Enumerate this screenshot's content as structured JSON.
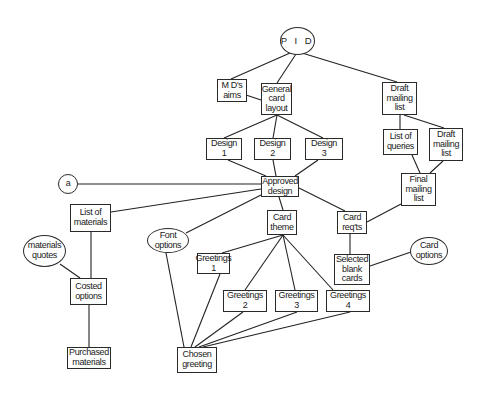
{
  "diagram": {
    "type": "product-flow-diagram",
    "nodes": {
      "pid": {
        "shape": "ellipse",
        "lines": [
          "P I D"
        ]
      },
      "md_aims": {
        "shape": "box",
        "lines": [
          "M  D's",
          "aims"
        ]
      },
      "general_card_layout": {
        "shape": "box",
        "lines": [
          "General",
          "card",
          "layout"
        ]
      },
      "draft_mailing_list": {
        "shape": "box",
        "lines": [
          "Draft",
          "mailing",
          "list"
        ]
      },
      "design_1": {
        "shape": "box",
        "lines": [
          "Design",
          "1"
        ]
      },
      "design_2": {
        "shape": "box",
        "lines": [
          "Design",
          "2"
        ]
      },
      "design_3": {
        "shape": "box",
        "lines": [
          "Design",
          "3"
        ]
      },
      "list_of_queries": {
        "shape": "box",
        "lines": [
          "List  of",
          "queries"
        ]
      },
      "draft_mailing_list_2": {
        "shape": "box",
        "lines": [
          "Draft",
          "mailing",
          "list"
        ]
      },
      "connector_a": {
        "shape": "circle",
        "lines": [
          "a"
        ]
      },
      "approved_design": {
        "shape": "box",
        "lines": [
          "Approved",
          "design"
        ]
      },
      "final_mailing_list": {
        "shape": "box",
        "lines": [
          "Final",
          "mailing",
          "list"
        ]
      },
      "list_of_materials": {
        "shape": "box",
        "lines": [
          "List  of",
          "materials"
        ]
      },
      "font_options": {
        "shape": "ellipse",
        "lines": [
          "Font",
          "options"
        ]
      },
      "card_theme": {
        "shape": "box",
        "lines": [
          "Card",
          "theme"
        ]
      },
      "card_reqts": {
        "shape": "box",
        "lines": [
          "Card",
          "req'ts"
        ]
      },
      "materials_quotes": {
        "shape": "ellipse",
        "lines": [
          "materials",
          "quotes"
        ]
      },
      "greetings_1": {
        "shape": "box",
        "lines": [
          "Greetings",
          "1"
        ]
      },
      "selected_blank_cards": {
        "shape": "box",
        "lines": [
          "Selected",
          "blank",
          "cards"
        ]
      },
      "card_options": {
        "shape": "ellipse",
        "lines": [
          "Card",
          "options"
        ]
      },
      "costed_options": {
        "shape": "box",
        "lines": [
          "Costed",
          "options"
        ]
      },
      "greetings_2": {
        "shape": "box",
        "lines": [
          "Greetings",
          "2"
        ]
      },
      "greetings_3": {
        "shape": "box",
        "lines": [
          "Greetings",
          "3"
        ]
      },
      "greetings_4": {
        "shape": "box",
        "lines": [
          "Greetings",
          "4"
        ]
      },
      "purchased_materials": {
        "shape": "box",
        "lines": [
          "Purchased",
          "materials"
        ]
      },
      "chosen_greeting": {
        "shape": "box",
        "lines": [
          "Chosen",
          "greeting"
        ]
      }
    },
    "edges": [
      [
        "pid",
        "md_aims"
      ],
      [
        "pid",
        "general_card_layout"
      ],
      [
        "pid",
        "draft_mailing_list"
      ],
      [
        "md_aims",
        "general_card_layout"
      ],
      [
        "general_card_layout",
        "design_1"
      ],
      [
        "general_card_layout",
        "design_2"
      ],
      [
        "general_card_layout",
        "design_3"
      ],
      [
        "design_1",
        "approved_design"
      ],
      [
        "design_2",
        "approved_design"
      ],
      [
        "design_3",
        "approved_design"
      ],
      [
        "connector_a",
        "approved_design"
      ],
      [
        "list_of_materials",
        "approved_design"
      ],
      [
        "font_options",
        "approved_design"
      ],
      [
        "approved_design",
        "card_theme"
      ],
      [
        "approved_design",
        "card_reqts"
      ],
      [
        "draft_mailing_list",
        "list_of_queries"
      ],
      [
        "draft_mailing_list",
        "draft_mailing_list_2"
      ],
      [
        "list_of_queries",
        "final_mailing_list"
      ],
      [
        "draft_mailing_list_2",
        "final_mailing_list"
      ],
      [
        "final_mailing_list",
        "card_reqts"
      ],
      [
        "card_reqts",
        "selected_blank_cards"
      ],
      [
        "selected_blank_cards",
        "card_options"
      ],
      [
        "list_of_materials",
        "costed_options"
      ],
      [
        "materials_quotes",
        "costed_options"
      ],
      [
        "costed_options",
        "purchased_materials"
      ],
      [
        "card_theme",
        "greetings_1"
      ],
      [
        "card_theme",
        "greetings_2"
      ],
      [
        "card_theme",
        "greetings_3"
      ],
      [
        "card_theme",
        "greetings_4"
      ],
      [
        "greetings_1",
        "chosen_greeting"
      ],
      [
        "greetings_2",
        "chosen_greeting"
      ],
      [
        "greetings_3",
        "chosen_greeting"
      ],
      [
        "greetings_4",
        "chosen_greeting"
      ],
      [
        "font_options",
        "chosen_greeting"
      ]
    ],
    "colors": {
      "line": "#222222",
      "background": "#ffffff",
      "text": "#1a1a1a"
    }
  }
}
